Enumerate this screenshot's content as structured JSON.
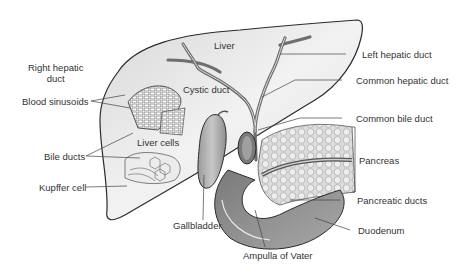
{
  "labels": {
    "liver": "Liver",
    "right_hepatic_duct_1": "Right hepatic",
    "right_hepatic_duct_2": "duct",
    "left_hepatic_duct": "Left hepatic duct",
    "common_hepatic_duct": "Common hepatic duct",
    "cystic_duct": "Cystic duct",
    "blood_sinusoids": "Blood sinusoids",
    "common_bile_duct": "Common bile duct",
    "pancreas": "Pancreas",
    "bile_ducts": "Bile ducts",
    "liver_cells": "Liver cells",
    "kupffer_cell": "Kupffer cell",
    "pancreatic_ducts": "Pancreatic ducts",
    "gallbladder": "Gallbladder",
    "duodenum": "Duodenum",
    "ampulla_of_vater": "Ampulla of Vater"
  },
  "colors": {
    "outline": "#2b2b2b",
    "liver_fill": "#e6e6e6",
    "organ_dark": "#8a8a8a",
    "organ_mid": "#b5b5b5",
    "leader": "#444444"
  }
}
